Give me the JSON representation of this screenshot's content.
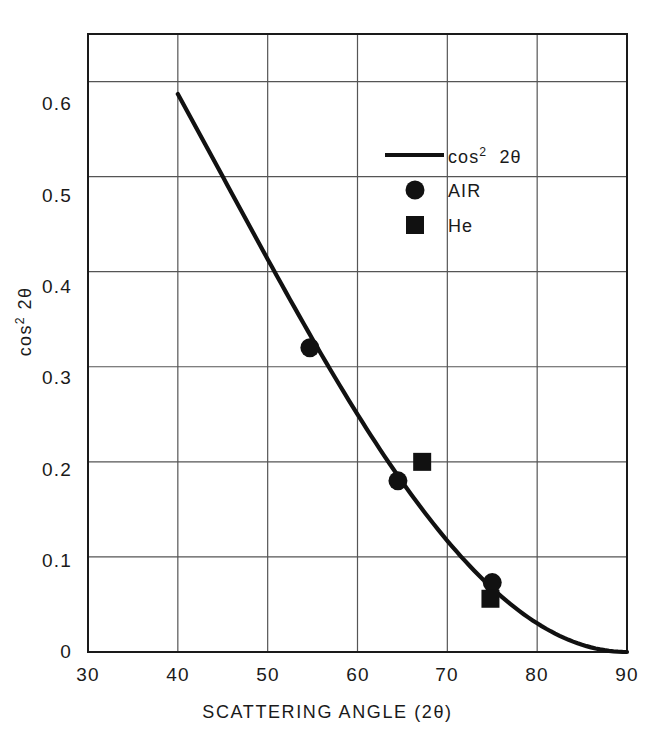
{
  "chart_data": {
    "type": "line",
    "title": "",
    "xlabel": "SCATTERING ANGLE (2θ)",
    "ylabel": "cos² 2θ",
    "xlim": [
      30,
      90
    ],
    "ylim": [
      0,
      0.65
    ],
    "xticks": [
      30,
      40,
      50,
      60,
      70,
      80,
      90
    ],
    "xtick_labels": [
      "30",
      "40",
      "50",
      "60",
      "70",
      "80",
      "90"
    ],
    "yticks": [
      0,
      0.1,
      0.2,
      0.3,
      0.4,
      0.5,
      0.6
    ],
    "ytick_labels": [
      "0",
      "0.1",
      "0.2",
      "0.3",
      "0.4",
      "0.5",
      "0.6"
    ],
    "grid": true,
    "legend_position": "upper right",
    "series": [
      {
        "name": "cos² 2θ",
        "marker": "line",
        "kind": "line",
        "x": [
          40,
          45,
          50,
          55,
          60,
          65,
          70,
          75,
          80,
          85,
          90
        ],
        "y": [
          0.587,
          0.5,
          0.413,
          0.329,
          0.25,
          0.179,
          0.117,
          0.067,
          0.03,
          0.008,
          0.0
        ]
      },
      {
        "name": "AIR",
        "marker": "circle",
        "kind": "scatter",
        "x": [
          54.7,
          64.5,
          75.0
        ],
        "y": [
          0.32,
          0.18,
          0.073
        ]
      },
      {
        "name": "He",
        "marker": "square",
        "kind": "scatter",
        "x": [
          67.2,
          74.8
        ],
        "y": [
          0.2,
          0.056
        ]
      }
    ]
  },
  "axes": {
    "y_axis_title_base": "cos",
    "y_axis_title_sup": "2",
    "y_axis_title_tail": "2θ",
    "x_axis_title": "SCATTERING ANGLE (2θ)"
  },
  "legend": {
    "entries": [
      {
        "label_base": "cos",
        "label_sup": "2",
        "label_tail": "2θ",
        "symbol": "line-swatch",
        "name": "cos-squared-2theta"
      },
      {
        "label_base": "AIR",
        "label_sup": "",
        "label_tail": "",
        "symbol": "circle-marker",
        "name": "air"
      },
      {
        "label_base": "He",
        "label_sup": "",
        "label_tail": "",
        "symbol": "square-marker",
        "name": "helium"
      }
    ]
  },
  "style": {
    "line_color": "#111111",
    "grid_color": "#555555",
    "axis_color": "#1a1a1a",
    "background": "#ffffff"
  }
}
